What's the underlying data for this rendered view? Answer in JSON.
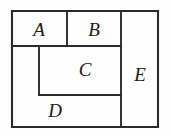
{
  "figure": {
    "kind": "rectangle-partition-diagram",
    "background_color": "#fefefe",
    "line_color": "#2b2b2b",
    "label_color": "#1a1a1a",
    "label_font_size_px": 19,
    "canvas": {
      "width": 170,
      "height": 137
    },
    "outer_rect": {
      "x": 12,
      "y": 11,
      "width": 146,
      "height": 116
    },
    "regions": [
      {
        "id": "region-a",
        "label": "A",
        "x": 12,
        "y": 11,
        "width": 55,
        "height": 35,
        "label_x": 39,
        "label_y": 36
      },
      {
        "id": "region-b",
        "label": "B",
        "x": 67,
        "y": 11,
        "width": 54,
        "height": 35,
        "label_x": 94,
        "label_y": 36
      },
      {
        "id": "region-c",
        "label": "C",
        "x": 39,
        "y": 46,
        "width": 82,
        "height": 49,
        "label_x": 85,
        "label_y": 76
      },
      {
        "id": "region-d",
        "label": "D",
        "x": 12,
        "y": 46,
        "width": 109,
        "height": 81,
        "label_x": 55,
        "label_y": 117
      },
      {
        "id": "region-e",
        "label": "E",
        "x": 121,
        "y": 11,
        "width": 37,
        "height": 116,
        "label_x": 140,
        "label_y": 81
      }
    ],
    "edges": [
      {
        "id": "outer-top",
        "x1": 12,
        "y1": 11,
        "x2": 158,
        "y2": 11
      },
      {
        "id": "outer-right",
        "x1": 158,
        "y1": 11,
        "x2": 158,
        "y2": 127
      },
      {
        "id": "outer-bottom",
        "x1": 12,
        "y1": 127,
        "x2": 158,
        "y2": 127
      },
      {
        "id": "outer-left",
        "x1": 12,
        "y1": 11,
        "x2": 12,
        "y2": 127
      },
      {
        "id": "divider-e-left",
        "x1": 121,
        "y1": 11,
        "x2": 121,
        "y2": 127
      },
      {
        "id": "divider-a-b",
        "x1": 67,
        "y1": 11,
        "x2": 67,
        "y2": 46
      },
      {
        "id": "divider-ab-below",
        "x1": 12,
        "y1": 46,
        "x2": 121,
        "y2": 46
      },
      {
        "id": "divider-c-left",
        "x1": 39,
        "y1": 46,
        "x2": 39,
        "y2": 95
      },
      {
        "id": "divider-c-bottom",
        "x1": 39,
        "y1": 95,
        "x2": 121,
        "y2": 95
      }
    ]
  }
}
